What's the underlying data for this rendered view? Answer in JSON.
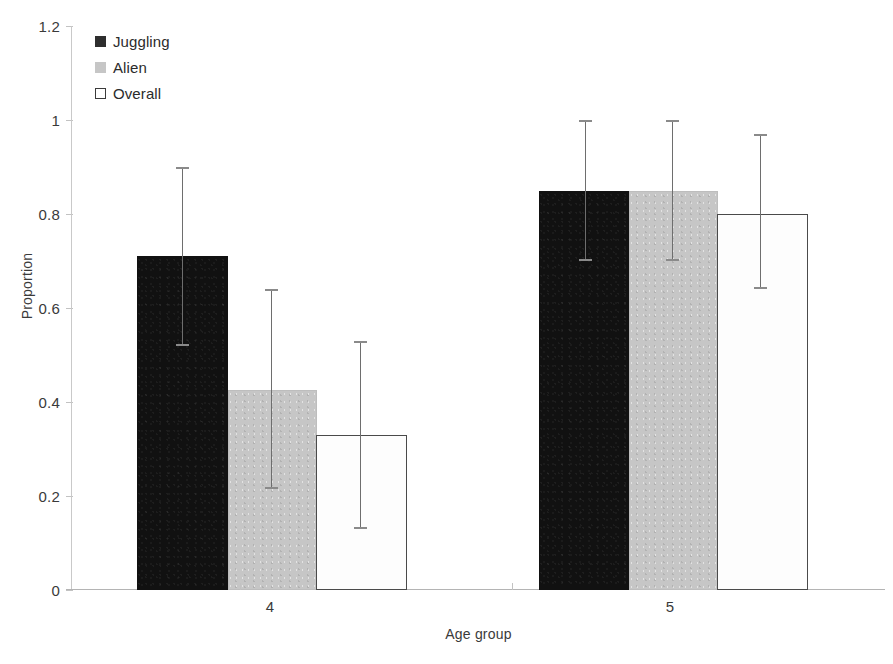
{
  "chart_data": {
    "type": "bar",
    "title": "",
    "subtitle": "",
    "xlabel": "Age group",
    "ylabel": "Proportion",
    "categories": [
      "4",
      "5"
    ],
    "xtick_labels": [
      "4",
      "5"
    ],
    "ytick_labels": [
      "0",
      "0.2",
      "0.4",
      "0.6",
      "0.8",
      "1",
      "1.2"
    ],
    "ytick_values": [
      0,
      0.2,
      0.4,
      0.6,
      0.8,
      1,
      1.2
    ],
    "ylim": [
      0,
      1.2
    ],
    "grid": false,
    "legend_position": "top-left",
    "error_bar_type": "95% confidence interval",
    "series": [
      {
        "name": "Juggling",
        "color": "#111111",
        "swatch": "filled-dark-square",
        "values": [
          0.71,
          0.85
        ],
        "error_upper": [
          0.9,
          1.0
        ],
        "error_lower": [
          0.52,
          0.7
        ]
      },
      {
        "name": "Alien",
        "color": "#c6c6c6",
        "swatch": "filled-gray-square",
        "values": [
          0.425,
          0.85
        ],
        "error_upper": [
          0.64,
          1.0
        ],
        "error_lower": [
          0.215,
          0.7
        ]
      },
      {
        "name": "Overall",
        "color": "#ffffff",
        "swatch": "outlined-white-square",
        "values": [
          0.33,
          0.8
        ],
        "error_upper": [
          0.53,
          0.97
        ],
        "error_lower": [
          0.13,
          0.64
        ]
      }
    ]
  },
  "legend": {
    "items": [
      {
        "label": "Juggling",
        "key": "juggling"
      },
      {
        "label": "Alien",
        "key": "alien"
      },
      {
        "label": "Overall",
        "key": "overall"
      }
    ]
  },
  "colors": {
    "juggling": "#111111",
    "alien": "#c6c6c6",
    "overall": "#ffffff",
    "axis": "#c2c2c2",
    "error_bar": "#6e6e6e",
    "text": "#2b2b2b"
  }
}
